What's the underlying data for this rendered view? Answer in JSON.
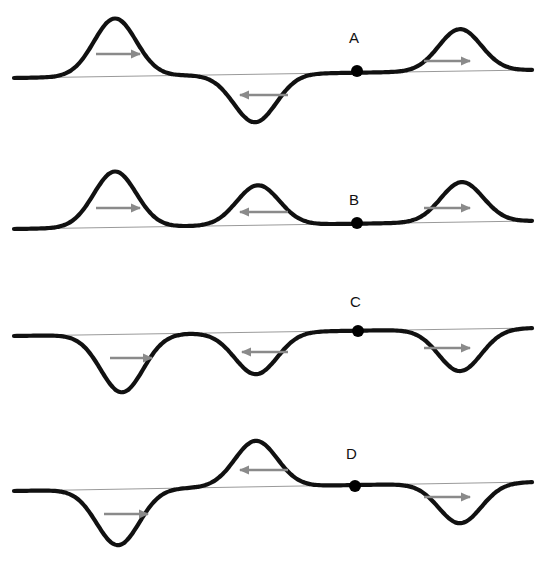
{
  "figure": {
    "background_color": "#ffffff",
    "wave_color": "#111111",
    "baseline_color": "#9a9a9a",
    "arrow_color": "#8a8a8a",
    "dot_color": "#000000",
    "wave_stroke_width": 4.2,
    "baseline_stroke_width": 1,
    "arrow_stroke_width": 2.4
  },
  "chart_data": {
    "type": "line",
    "title": "",
    "xlabel": "",
    "ylabel": "",
    "grid": false,
    "legend": "none",
    "panels": [
      {
        "label": "A",
        "label_x": 355,
        "label_y": 38,
        "dot_x": 357,
        "dot_y": 71,
        "baseline_y_left": 78,
        "baseline_y_right": 70,
        "features": [
          {
            "kind": "crest",
            "center_x": 115,
            "extreme_y": 20,
            "amplitude_px": 58,
            "direction": "right"
          },
          {
            "kind": "trough",
            "center_x": 255,
            "extreme_y": 122,
            "amplitude_px": 48,
            "direction": "left"
          },
          {
            "kind": "crest",
            "center_x": 460,
            "extreme_y": 29,
            "amplitude_px": 42,
            "direction": "right"
          }
        ],
        "arrows": [
          {
            "x1": 96,
            "x2": 140,
            "y": 54,
            "direction": "right"
          },
          {
            "x1": 288,
            "x2": 240,
            "y": 95,
            "direction": "left"
          },
          {
            "x1": 424,
            "x2": 470,
            "y": 61,
            "direction": "right"
          }
        ]
      },
      {
        "label": "B",
        "label_x": 355,
        "label_y": 192,
        "dot_x": 357,
        "dot_y": 223,
        "baseline_y_left": 229,
        "baseline_y_right": 221,
        "features": [
          {
            "kind": "crest",
            "center_x": 115,
            "extreme_y": 172,
            "amplitude_px": 56,
            "direction": "right"
          },
          {
            "kind": "crest",
            "center_x": 258,
            "extreme_y": 186,
            "amplitude_px": 40,
            "direction": "left"
          },
          {
            "kind": "crest",
            "center_x": 462,
            "extreme_y": 182,
            "amplitude_px": 40,
            "direction": "right"
          }
        ],
        "arrows": [
          {
            "x1": 96,
            "x2": 140,
            "y": 208,
            "direction": "right"
          },
          {
            "x1": 288,
            "x2": 240,
            "y": 212,
            "direction": "left"
          },
          {
            "x1": 424,
            "x2": 470,
            "y": 208,
            "direction": "right"
          }
        ]
      },
      {
        "label": "C",
        "label_x": 356,
        "label_y": 301,
        "dot_x": 358,
        "dot_y": 331,
        "baseline_y_left": 336,
        "baseline_y_right": 328,
        "features": [
          {
            "kind": "trough",
            "center_x": 122,
            "extreme_y": 393,
            "amplitude_px": 58,
            "direction": "right"
          },
          {
            "kind": "trough",
            "center_x": 256,
            "extreme_y": 375,
            "amplitude_px": 42,
            "direction": "left"
          },
          {
            "kind": "trough",
            "center_x": 460,
            "extreme_y": 372,
            "amplitude_px": 42,
            "direction": "right"
          }
        ],
        "arrows": [
          {
            "x1": 110,
            "x2": 152,
            "y": 358,
            "direction": "right"
          },
          {
            "x1": 288,
            "x2": 242,
            "y": 352,
            "direction": "left"
          },
          {
            "x1": 424,
            "x2": 470,
            "y": 348,
            "direction": "right"
          }
        ]
      },
      {
        "label": "D",
        "label_x": 352,
        "label_y": 454,
        "dot_x": 355,
        "dot_y": 486,
        "baseline_y_left": 491,
        "baseline_y_right": 482,
        "features": [
          {
            "kind": "trough",
            "center_x": 118,
            "extreme_y": 546,
            "amplitude_px": 56,
            "direction": "right"
          },
          {
            "kind": "crest",
            "center_x": 256,
            "extreme_y": 441,
            "amplitude_px": 46,
            "direction": "left"
          },
          {
            "kind": "trough",
            "center_x": 460,
            "extreme_y": 521,
            "amplitude_px": 40,
            "direction": "right"
          }
        ],
        "arrows": [
          {
            "x1": 104,
            "x2": 148,
            "y": 514,
            "direction": "right"
          },
          {
            "x1": 288,
            "x2": 240,
            "y": 470,
            "direction": "left"
          },
          {
            "x1": 424,
            "x2": 470,
            "y": 497,
            "direction": "right"
          }
        ]
      }
    ]
  },
  "panel_labels": {
    "a": "A",
    "b": "B",
    "c": "C",
    "d": "D"
  }
}
